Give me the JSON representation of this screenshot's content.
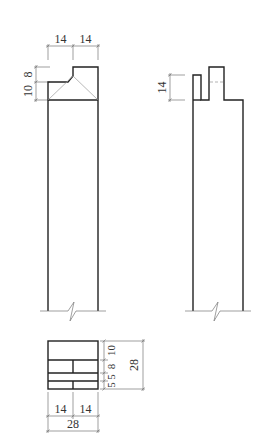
{
  "drawing": {
    "front_elevation": {
      "top_dims": [
        "14",
        "14"
      ],
      "side_dims": [
        "10",
        "8"
      ]
    },
    "side_elevation": {
      "side_dim": "14"
    },
    "plan": {
      "bottom_dims": [
        "14",
        "14"
      ],
      "total_width": "28",
      "right_dims": [
        "10",
        "8",
        "5",
        "5"
      ],
      "total_height": "28"
    },
    "colors": {
      "line": "#222222",
      "dimension": "#777777",
      "background": "#ffffff"
    }
  }
}
